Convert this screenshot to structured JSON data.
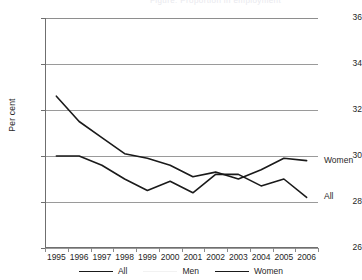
{
  "header": {
    "clipped_text": "Figure: Proportion in employment"
  },
  "axes": {
    "ylabel": "Per cent",
    "yticks": [
      36,
      34,
      32,
      30,
      28,
      26
    ],
    "xticks": [
      "1995",
      "1996",
      "1997",
      "1998",
      "1999",
      "2000",
      "2001",
      "2002",
      "2003",
      "2004",
      "2005",
      "2006"
    ]
  },
  "end_labels": {
    "women": "Women",
    "all": "All"
  },
  "legend": {
    "items": [
      {
        "label": "All",
        "key": "all"
      },
      {
        "label": "Men",
        "key": "men"
      },
      {
        "label": "Women",
        "key": "women"
      }
    ]
  },
  "colors": {
    "line": "#1a1a1a",
    "men_line": "#f2f2f2",
    "grid": "#9a9a9a",
    "axis": "#6f6f6f"
  },
  "chart_data": {
    "type": "line",
    "title": "",
    "xlabel": "",
    "ylabel": "Per cent",
    "ylim": [
      26,
      36
    ],
    "grid": true,
    "legend_position": "bottom",
    "x": [
      "1995",
      "1996",
      "1997",
      "1998",
      "1999",
      "2000",
      "2001",
      "2002",
      "2003",
      "2004",
      "2005",
      "2006"
    ],
    "series": [
      {
        "name": "All",
        "values": [
          30.0,
          30.0,
          29.6,
          29.0,
          28.5,
          28.9,
          28.4,
          29.2,
          29.2,
          28.7,
          29.0,
          28.2
        ]
      },
      {
        "name": "Men",
        "values": [
          null,
          null,
          null,
          null,
          null,
          null,
          null,
          null,
          null,
          null,
          null,
          null
        ]
      },
      {
        "name": "Women",
        "values": [
          32.6,
          31.5,
          30.8,
          30.1,
          29.9,
          29.6,
          29.1,
          29.3,
          29.0,
          29.4,
          29.9,
          29.8
        ]
      }
    ]
  }
}
